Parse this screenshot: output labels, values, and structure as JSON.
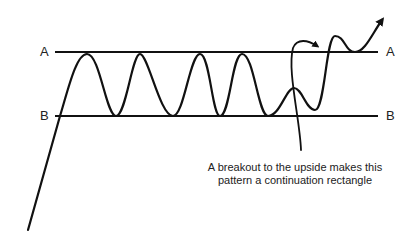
{
  "diagram": {
    "type": "continuation rectangle chart pattern",
    "lines": {
      "top": {
        "label": "A"
      },
      "bottom": {
        "label": "B"
      }
    },
    "annotation": {
      "line1": "A breakout to the upside makes this",
      "line2": "pattern a continuation rectangle"
    },
    "colors": {
      "stroke": "#111111",
      "background": "#ffffff",
      "text": "#222222"
    }
  }
}
